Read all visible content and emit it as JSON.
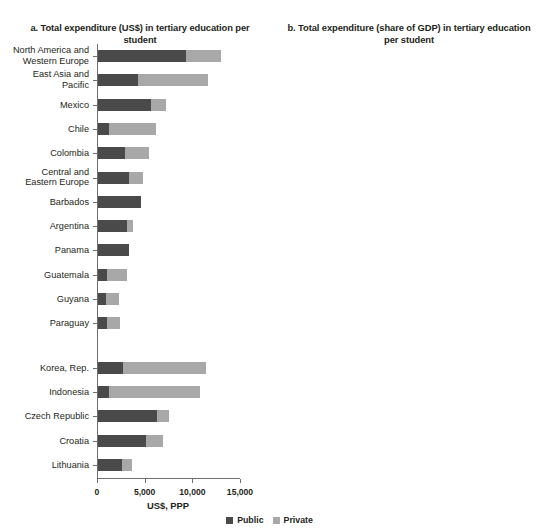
{
  "legend": {
    "items": [
      {
        "label": "Public",
        "color": "#4a4a4a"
      },
      {
        "label": "Private",
        "color": "#a8a8a8"
      }
    ]
  },
  "panel_a": {
    "title": "a. Total expenditure (US$) in tertiary\neducation per student",
    "xlabel": "US$, PPP",
    "xticks": [
      "0",
      "5,000",
      "10,000",
      "15,000"
    ]
  },
  "panel_b": {
    "title": "b. Total expenditure (share of GDP) in\ntertiary education per student",
    "xlabel": "% of GDP per capita",
    "xticks": [
      "0",
      "50",
      "100",
      "150"
    ]
  },
  "chart_data": [
    {
      "type": "bar",
      "orientation": "horizontal",
      "stacked": true,
      "panel": "a",
      "title": "a. Total expenditure (US$) in tertiary education per student",
      "xlabel": "US$, PPP",
      "ylabel": "",
      "xlim": [
        0,
        15000
      ],
      "xticks": [
        0,
        5000,
        10000,
        15000
      ],
      "grid": false,
      "legend_position": "bottom-center",
      "categories": [
        "North America and Western Europe",
        "East Asia and Pacific",
        "Mexico",
        "Chile",
        "Colombia",
        "Central and Eastern Europe",
        "Barbados",
        "Argentina",
        "Panama",
        "Guatemala",
        "Guyana",
        "Paraguay",
        "Korea, Rep.",
        "Indonesia",
        "Czech Republic",
        "Croatia",
        "Lithuania"
      ],
      "group_break_after": "Paraguay",
      "series": [
        {
          "name": "Public",
          "color": "#4a4a4a",
          "values": [
            9200,
            4200,
            5600,
            1200,
            2800,
            3200,
            4500,
            3000,
            3300,
            900,
            800,
            900,
            2600,
            1200,
            6200,
            5000,
            2500
          ]
        },
        {
          "name": "Private",
          "color": "#a8a8a8",
          "values": [
            3700,
            7300,
            1500,
            4900,
            2500,
            1500,
            0,
            700,
            0,
            2100,
            1400,
            1400,
            8700,
            9500,
            1300,
            1800,
            1100
          ]
        }
      ],
      "totals": [
        12900,
        11500,
        7100,
        6100,
        5300,
        4700,
        4500,
        3700,
        3300,
        3000,
        2200,
        2300,
        11300,
        10700,
        7500,
        6800,
        3600
      ]
    },
    {
      "type": "bar",
      "orientation": "horizontal",
      "stacked": true,
      "panel": "b",
      "title": "b. Total expenditure (share of GDP) in tertiary education per student",
      "xlabel": "% of GDP per capita",
      "ylabel": "",
      "xlim": [
        0,
        150
      ],
      "xticks": [
        0,
        50,
        100,
        150
      ],
      "grid": false,
      "legend_position": "bottom-center",
      "categories": [
        "East Asia and Pacific",
        "Colombia",
        "Mexico",
        "Guatemala",
        "Guyana",
        "Chile",
        "Paraguay",
        "North America and Western Europe",
        "Barbados",
        "Central and Eastern Europe",
        "Panama",
        "Argentina",
        "Indonesia",
        "Korea, Rep.",
        "Croatia",
        "Czech Republic",
        "Lithuania"
      ],
      "group_break_after": "Argentina",
      "series": [
        {
          "name": "Public",
          "color": "#4a4a4a",
          "values": [
            10,
            18,
            25,
            17,
            19,
            5,
            17,
            17,
            30,
            15,
            24,
            15,
            15,
            9,
            25,
            24,
            14
          ]
        },
        {
          "name": "Private",
          "color": "#a8a8a8",
          "values": [
            46,
            34,
            8,
            33,
            25,
            30,
            20,
            16,
            0,
            10,
            0,
            4,
            120,
            31,
            10,
            3,
            5
          ]
        }
      ],
      "totals": [
        56,
        52,
        33,
        50,
        44,
        35,
        37,
        33,
        30,
        25,
        24,
        19,
        135,
        40,
        35,
        27,
        19
      ]
    }
  ]
}
